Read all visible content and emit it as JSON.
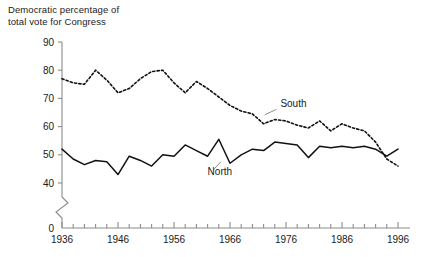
{
  "chart_data": {
    "type": "line",
    "title": "Democratic percentage of total vote for Congress",
    "title_line1": "Democratic percentage of",
    "title_line2": "total vote for Congress",
    "xlabel": "",
    "ylabel": "",
    "xlim": [
      1936,
      1996
    ],
    "ylim": [
      40,
      90
    ],
    "y_axis_break": true,
    "y_axis_break_label": "0",
    "grid": false,
    "legend_position": "inline-annotations",
    "ytick_labels": [
      "90",
      "80",
      "70",
      "60",
      "50",
      "40",
      "0"
    ],
    "yticks": [
      90,
      80,
      70,
      60,
      50,
      40,
      0
    ],
    "xtick_labels": [
      "1936",
      "1946",
      "1956",
      "1966",
      "1976",
      "1986",
      "1996"
    ],
    "xticks_major": [
      1936,
      1946,
      1956,
      1966,
      1976,
      1986,
      1996
    ],
    "xticks_minor_step": 2,
    "x": [
      1936,
      1938,
      1940,
      1942,
      1944,
      1946,
      1948,
      1950,
      1952,
      1954,
      1956,
      1958,
      1960,
      1962,
      1964,
      1966,
      1968,
      1970,
      1972,
      1974,
      1976,
      1978,
      1980,
      1982,
      1984,
      1986,
      1988,
      1990,
      1992,
      1994,
      1996
    ],
    "series": [
      {
        "name": "South",
        "style": "dashed",
        "color": "#111111",
        "values": [
          77,
          75.5,
          75,
          80,
          76.5,
          72,
          73.5,
          77,
          79.5,
          80,
          75.5,
          72,
          76,
          73.5,
          70.5,
          67.5,
          65.5,
          64.5,
          61,
          62.5,
          62,
          60.5,
          59.5,
          62,
          58.5,
          61,
          59.5,
          58.5,
          54.5,
          48.5,
          46
        ]
      },
      {
        "name": "North",
        "style": "solid",
        "color": "#111111",
        "values": [
          52,
          48.5,
          46.5,
          48,
          47.5,
          43,
          49.5,
          48,
          46,
          50,
          49.5,
          53.5,
          51.5,
          49.5,
          55.5,
          47,
          50,
          52,
          51.5,
          54.5,
          54,
          53.5,
          49,
          53,
          52.5,
          53,
          52.5,
          53,
          52,
          49.5,
          52
        ]
      }
    ],
    "annotations": [
      {
        "text": "South",
        "x": 1975,
        "y": 67
      },
      {
        "text": "North",
        "x": 1962,
        "y": 43
      }
    ]
  }
}
